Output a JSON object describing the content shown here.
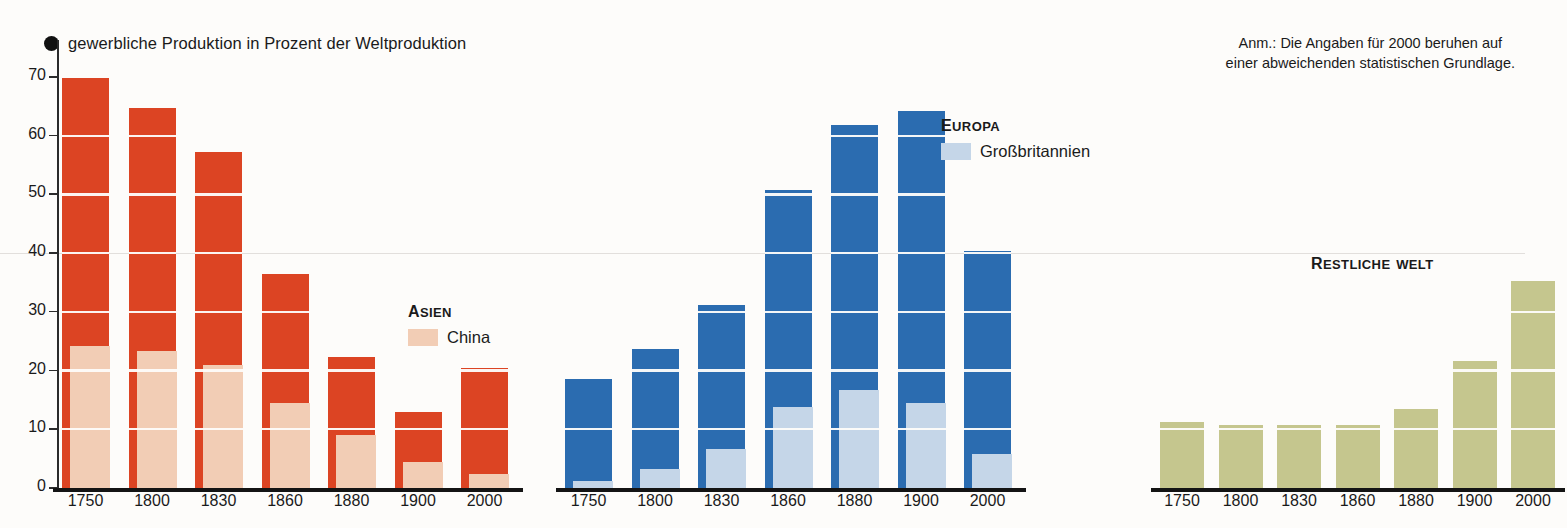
{
  "title": "gewerbliche Produktion in Prozent der Weltproduktion",
  "note": "Anm.: Die Angaben für 2000 beruhen auf\neiner abweichenden statistischen Grundlage.",
  "legends": {
    "asia": {
      "title": "Asien",
      "sub_label": "China",
      "color": "#DC4423",
      "sub_color": "#F2CDB5"
    },
    "europe": {
      "title": "Europa",
      "sub_label": "Großbritannien",
      "color": "#2B6CB0",
      "sub_color": "#C5D6E8"
    },
    "rest": {
      "title": "Restliche Welt",
      "color": "#C5C68E"
    }
  },
  "chart_data": {
    "type": "bar",
    "title": "gewerbliche Produktion in Prozent der Weltproduktion",
    "xlabel": "",
    "ylabel": "Prozent der Weltproduktion",
    "ylim": [
      0,
      70
    ],
    "yticks": [
      0,
      10,
      20,
      30,
      40,
      50,
      60,
      70
    ],
    "grid": "horizontal white separators every 10 units inside bars",
    "legend_position": "inline above each group",
    "annotation": "Anm.: Die Angaben für 2000 beruhen auf einer abweichenden statistischen Grundlage.",
    "categories": [
      "1750",
      "1800",
      "1830",
      "1860",
      "1880",
      "1900",
      "2000"
    ],
    "groups": [
      {
        "name": "Asien",
        "color": "#DC4423",
        "values": [
          69.8,
          64.8,
          57.3,
          36.5,
          22.3,
          13.0,
          20.5
        ],
        "sub_series": {
          "name": "China",
          "color": "#F2CDB5",
          "values": [
            24.2,
            23.3,
            21.0,
            14.5,
            9.0,
            4.5,
            2.3
          ]
        }
      },
      {
        "name": "Europa",
        "color": "#2B6CB0",
        "values": [
          18.5,
          23.6,
          31.2,
          50.7,
          61.9,
          64.2,
          40.3
        ],
        "sub_series": {
          "name": "Großbritannien",
          "color": "#C5D6E8",
          "values": [
            1.2,
            3.3,
            6.7,
            13.8,
            16.7,
            14.5,
            5.8
          ]
        }
      },
      {
        "name": "Restliche Welt",
        "color": "#C5C68E",
        "values": [
          11.3,
          10.8,
          10.8,
          10.7,
          13.4,
          21.7,
          35.2
        ],
        "sub_series": null
      }
    ]
  },
  "colors": {
    "asia": "#DC4423",
    "china": "#F2CDB5",
    "europe": "#2B6CB0",
    "britain": "#C5D6E8",
    "rest": "#C5C68E",
    "axis": "#141414",
    "background": "#fdfcfa"
  }
}
